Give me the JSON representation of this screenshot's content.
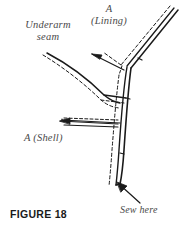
{
  "figure": {
    "caption": "FIGURE 18",
    "labels": {
      "underarm_line1": "Underarm",
      "underarm_line2": "seam",
      "lining_line1": "A",
      "lining_line2": "(Lining)",
      "shell": "A (Shell)",
      "sew_here": "Sew here"
    },
    "colors": {
      "background": "#ffffff",
      "stroke": "#1a1a1a",
      "label_text": "#4a4a4a",
      "caption_text": "#1a1a1a"
    }
  },
  "diagram_data": {
    "type": "technical-illustration",
    "subject": "garment underarm seam joining shell and lining",
    "elements": [
      {
        "name": "lining-strip",
        "style": "solid-double-line",
        "direction": "up-right"
      },
      {
        "name": "lining-seam-allowance",
        "style": "dashed-line",
        "direction": "up-right"
      },
      {
        "name": "shell-curve",
        "style": "solid-curve",
        "direction": "left-to-junction"
      },
      {
        "name": "shell-seam-allowance",
        "style": "dashed-curve",
        "direction": "left-to-junction"
      },
      {
        "name": "vertical-strip",
        "style": "solid-double-line",
        "direction": "down"
      },
      {
        "name": "vertical-seam-allowance",
        "style": "dashed-line",
        "direction": "down"
      },
      {
        "name": "leader-arrow-lining",
        "style": "arrow",
        "points_to": "lining-junction"
      },
      {
        "name": "leader-arrow-shell",
        "style": "arrow",
        "points_to": "shell-strip"
      },
      {
        "name": "leader-arrow-sew-here",
        "style": "arrow",
        "points_to": "strip-bottom"
      }
    ]
  }
}
